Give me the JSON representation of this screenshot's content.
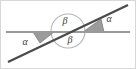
{
  "figure": {
    "kind": "geometry-diagram",
    "width": 136,
    "height": 69,
    "background_color": "#ffffff",
    "border_color": "#d8d8d8"
  },
  "colors": {
    "horizontal_line": "#9a9a9a",
    "transversal_line": "#4a4a4a",
    "circle_stroke": "#b5b5b5",
    "wedge_fill": "#9b9b9b",
    "wedge_stroke": "#7d7d7d",
    "label_text": "#3a3a3a"
  },
  "lines": [
    {
      "name": "horizontal-line",
      "x1": 6,
      "y1": 32,
      "x2": 130,
      "y2": 32,
      "stroke_width": 2.2
    },
    {
      "name": "transversal-line",
      "x1": 8,
      "y1": 62,
      "x2": 128,
      "y2": 5,
      "stroke_width": 2.2
    }
  ],
  "intersection": {
    "x": 68,
    "y": 31
  },
  "circle": {
    "name": "intersection-circle",
    "cx": 68,
    "cy": 31,
    "r": 17,
    "stroke_width": 1.1
  },
  "wedges": [
    {
      "name": "alpha-wedge-left",
      "points": "33,32 54,32 40,43",
      "angle_symbol": "alpha"
    },
    {
      "name": "alpha-wedge-right",
      "points": "83,32 104,32 101,19",
      "angle_symbol": "alpha"
    }
  ],
  "labels": [
    {
      "name": "angle-label-alpha-left",
      "text": "α",
      "x": 25,
      "y": 43
    },
    {
      "name": "angle-label-alpha-right",
      "text": "α",
      "x": 109,
      "y": 20
    },
    {
      "name": "angle-label-beta-top",
      "text": "β",
      "x": 65,
      "y": 22
    },
    {
      "name": "angle-label-beta-bottom",
      "text": "β",
      "x": 70,
      "y": 41
    }
  ]
}
